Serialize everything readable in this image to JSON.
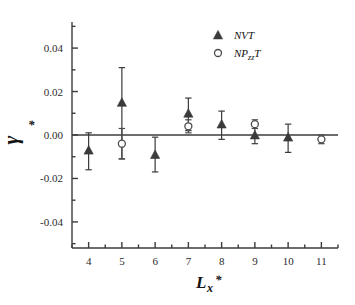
{
  "chart_data": {
    "type": "scatter",
    "title": "",
    "xlabel": "Lx*",
    "ylabel": "γ*",
    "xlim": [
      3.5,
      11.5
    ],
    "ylim": [
      -0.052,
      0.052
    ],
    "xticks": [
      4,
      5,
      6,
      7,
      8,
      9,
      10,
      11
    ],
    "xtick_labels": [
      "4",
      "5",
      "6",
      "7",
      "8",
      "9",
      "10",
      "11"
    ],
    "yticks": [
      -0.04,
      -0.02,
      0.0,
      0.02,
      0.04
    ],
    "ytick_labels": [
      "-0.04",
      "-0.02",
      "0.00",
      "0.02",
      "0.04"
    ],
    "minor_ticks": true,
    "grid": false,
    "zero_line": 0.0,
    "legend_position": "top-right",
    "series": [
      {
        "name": "NVT",
        "marker": "filled-triangle",
        "color": "#3a3a3a",
        "x": [
          4,
          5,
          6,
          7,
          8,
          9,
          10
        ],
        "y": [
          -0.007,
          0.015,
          -0.009,
          0.01,
          0.005,
          0.0,
          -0.001
        ],
        "yerr_upper": [
          0.008,
          0.016,
          0.008,
          0.007,
          0.006,
          0.004,
          0.006
        ],
        "yerr_lower": [
          0.009,
          0.026,
          0.008,
          0.008,
          0.007,
          0.004,
          0.007
        ]
      },
      {
        "name": "NPzzT",
        "marker": "open-circle",
        "color": "#4a4a4a",
        "x": [
          5,
          7,
          9,
          11
        ],
        "y": [
          -0.004,
          0.004,
          0.005,
          -0.002
        ],
        "yerr_upper": [
          0.007,
          0.003,
          0.002,
          0.002
        ],
        "yerr_lower": [
          0.007,
          0.003,
          0.002,
          0.002
        ]
      }
    ]
  },
  "legend": {
    "entries": [
      {
        "label": "NVT",
        "marker": "filled-triangle"
      },
      {
        "label": "NP",
        "sub": "zz",
        "tail": "T",
        "marker": "open-circle"
      }
    ]
  },
  "axes": {
    "y_axis_symbol": "γ",
    "y_axis_star": "*",
    "x_axis_symbol": "L",
    "x_axis_sub": "x",
    "x_axis_star": "*"
  },
  "colors": {
    "axis": "#3c3c3c",
    "marker_nvt": "#3a3a3a",
    "marker_npzzt": "#4a4a4a",
    "text": "#1f1f1f",
    "background": "#ffffff"
  }
}
